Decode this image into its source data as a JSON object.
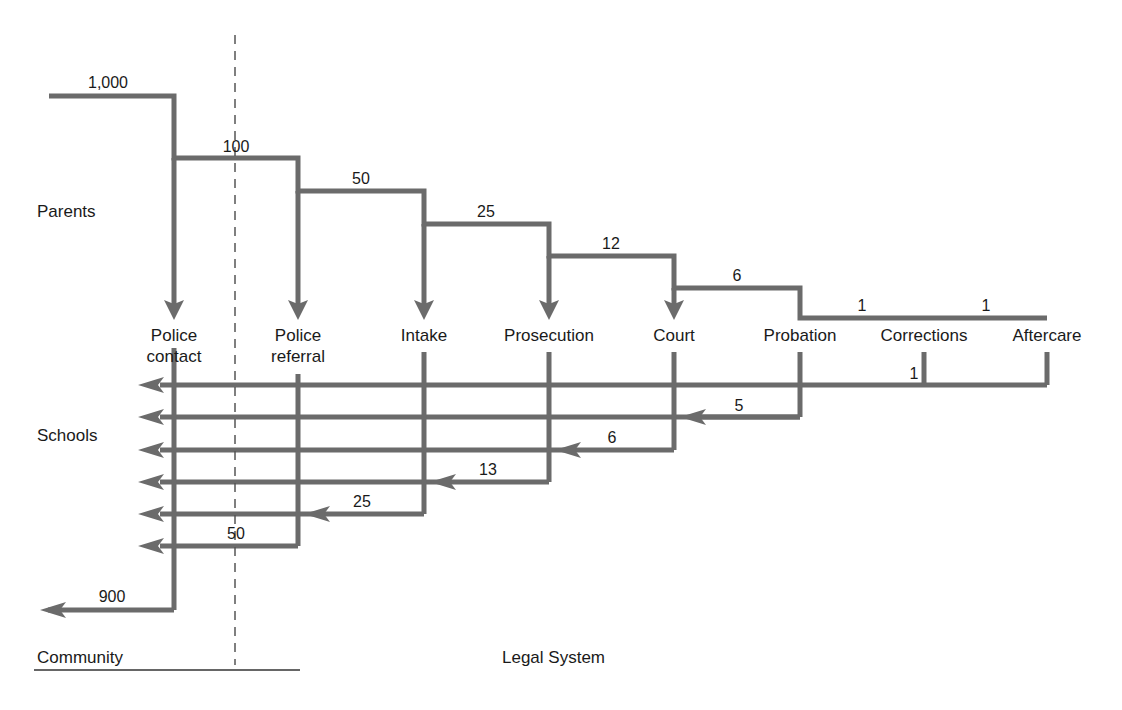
{
  "diagram": {
    "regions": {
      "community": "Community",
      "legal_system": "Legal System"
    },
    "sources": [
      "Parents",
      "Schools"
    ],
    "stages": [
      {
        "label": "Police contact",
        "line1": "Police",
        "line2": "contact"
      },
      {
        "label": "Police referral",
        "line1": "Police",
        "line2": "referral"
      },
      {
        "label": "Intake",
        "line1": "Intake",
        "line2": ""
      },
      {
        "label": "Prosecution",
        "line1": "Prosecution",
        "line2": ""
      },
      {
        "label": "Court",
        "line1": "Court",
        "line2": ""
      },
      {
        "label": "Probation",
        "line1": "Probation",
        "line2": ""
      },
      {
        "label": "Corrections",
        "line1": "Corrections",
        "line2": ""
      },
      {
        "label": "Aftercare",
        "line1": "Aftercare",
        "line2": ""
      }
    ],
    "inflow_counts": [
      "1,000",
      "100",
      "50",
      "25",
      "12",
      "6",
      "1",
      "1"
    ],
    "outflow_counts": {
      "community": "900",
      "police_referral": "50",
      "intake": "25",
      "prosecution": "13",
      "court": "6",
      "probation": "5",
      "corrections": "1"
    },
    "line_color": "#6b6b6b",
    "divider_color": "#555555"
  }
}
